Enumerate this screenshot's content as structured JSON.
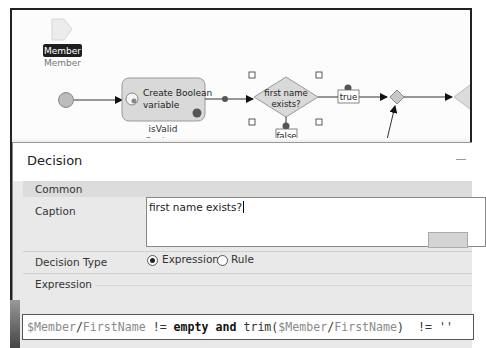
{
  "canvas": {
    "parameter": {
      "name_label": "Member",
      "type_label": "Member"
    },
    "start_event": {
      "shape": "circle"
    },
    "create_variable_activity": {
      "title_line1": "Create Boolean",
      "title_line2": "variable",
      "variable_name": "isValid",
      "variable_type": "Boolean",
      "icon": "create-variable-icon"
    },
    "decision": {
      "caption_line1": "first name",
      "caption_line2": "exists?",
      "true_label": "true",
      "false_label": "false"
    },
    "merge": {
      "shape": "diamond"
    }
  },
  "dialog": {
    "title": "Decision",
    "sections": {
      "common": "Common",
      "expression": "Expression"
    },
    "caption_label": "Caption",
    "caption_value": "first name exists?",
    "decision_type_label": "Decision Type",
    "decision_type_options": [
      {
        "label": "Expression",
        "selected": true
      },
      {
        "label": "Rule",
        "selected": false
      }
    ],
    "expression_tokens": [
      {
        "text": "$Member",
        "cls": "var"
      },
      {
        "text": "/",
        "cls": ""
      },
      {
        "text": "FirstName",
        "cls": "var"
      },
      {
        "text": " != ",
        "cls": ""
      },
      {
        "text": "empty",
        "cls": "kw"
      },
      {
        "text": " ",
        "cls": ""
      },
      {
        "text": "and",
        "cls": "kw"
      },
      {
        "text": " trim(",
        "cls": ""
      },
      {
        "text": "$Member",
        "cls": "var"
      },
      {
        "text": "/",
        "cls": ""
      },
      {
        "text": "FirstName",
        "cls": "var"
      },
      {
        "text": ")  != ''",
        "cls": ""
      }
    ],
    "expression_text": "$Member/FirstName != empty and trim($Member/FirstName)  != ''"
  },
  "colors": {
    "node_fill": "#d9d9d9",
    "node_stroke": "#999999",
    "dialog_bg": "#e9e9e9",
    "label_dark_bg": "#1e1e1e"
  }
}
